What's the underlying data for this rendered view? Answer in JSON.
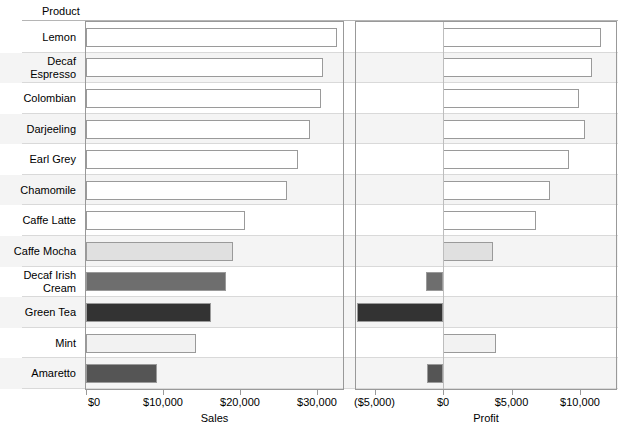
{
  "header": {
    "row_dimension_label": "Product"
  },
  "chart_data": {
    "type": "bar",
    "orientation": "horizontal",
    "title": "",
    "subtitle": "",
    "ylabel": "Product",
    "grid": false,
    "legend": "none",
    "categories": [
      "Lemon",
      "Decaf\nEspresso",
      "Colombian",
      "Darjeeling",
      "Earl Grey",
      "Chamomile",
      "Caffe Latte",
      "Caffe Mocha",
      "Decaf Irish\nCream",
      "Green Tea",
      "Mint",
      "Amaretto"
    ],
    "panels": [
      {
        "name": "Sales",
        "xlabel": "Sales",
        "xlim": [
          0,
          33000
        ],
        "tick_values": [
          0,
          10000,
          20000,
          30000
        ],
        "tick_labels": [
          "$0",
          "$10,000",
          "$20,000",
          "$30,000"
        ],
        "values": [
          32600,
          30800,
          30500,
          29100,
          27500,
          26100,
          20650,
          19100,
          18200,
          16200,
          14300,
          9200
        ]
      },
      {
        "name": "Profit",
        "xlabel": "Profit",
        "xlim": [
          -6800,
          12400
        ],
        "tick_values": [
          -5000,
          0,
          5000,
          10000
        ],
        "tick_labels": [
          "($5,000)",
          "$0",
          "$5,000",
          "$10,000"
        ],
        "values": [
          11530,
          10880,
          9930,
          10360,
          9200,
          7810,
          6790,
          3650,
          -1240,
          -6280,
          3870,
          -1170
        ]
      }
    ],
    "encoding": {
      "color_by": "Profit",
      "colors": [
        "#ffffff",
        "#ffffff",
        "#ffffff",
        "#ffffff",
        "#ffffff",
        "#ffffff",
        "#ffffff",
        "#e0e0e0",
        "#6e6e6e",
        "#333333",
        "#f2f2f2",
        "#555555"
      ]
    },
    "row_band_color": "#f4f4f4",
    "bar_outline_color": "#9a9a9a"
  }
}
